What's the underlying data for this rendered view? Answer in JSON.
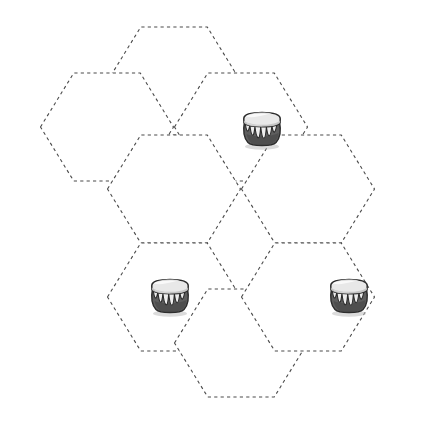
{
  "board": {
    "type": "hex-grid",
    "orientation": "flat-top",
    "width": 434,
    "height": 430,
    "background_color": "#ffffff",
    "cell_outline_color": "#4a4a4a",
    "cell_outline_style": "dashed",
    "cell_fill_color": "#ffffff",
    "hex_width": 133,
    "hex_height": 108,
    "cell_count": 7,
    "token_count": 3,
    "cells": [
      {
        "id": "cell-top-middle",
        "label": "Top Middle",
        "cx": 174,
        "cy": 81,
        "col": 1,
        "row": 0,
        "occupied": false,
        "token": null
      },
      {
        "id": "cell-upper-left",
        "label": "Upper Left",
        "cx": 107,
        "cy": 127,
        "col": 0,
        "row": 0,
        "occupied": false,
        "token": null
      },
      {
        "id": "cell-upper-right",
        "label": "Upper Right",
        "cx": 241,
        "cy": 127,
        "col": 2,
        "row": 0,
        "occupied": true,
        "token": "honey-pot"
      },
      {
        "id": "cell-center",
        "label": "Center",
        "cx": 174,
        "cy": 189,
        "col": 1,
        "row": 1,
        "occupied": false,
        "token": null
      },
      {
        "id": "cell-right",
        "label": "Right",
        "cx": 308,
        "cy": 189,
        "col": 3,
        "row": 0,
        "occupied": false,
        "token": null
      },
      {
        "id": "cell-lower-left",
        "label": "Lower Left",
        "cx": 174,
        "cy": 297,
        "col": 1,
        "row": 2,
        "occupied": true,
        "token": "honey-pot"
      },
      {
        "id": "cell-bottom-middle",
        "label": "Bottom Middle",
        "cx": 241,
        "cy": 343,
        "col": 2,
        "row": 2,
        "occupied": false,
        "token": null
      },
      {
        "id": "cell-lower-right",
        "label": "Lower Right",
        "cx": 308,
        "cy": 297,
        "col": 3,
        "row": 1,
        "occupied": true,
        "token": "honey-pot"
      }
    ]
  },
  "tokens": {
    "honey_pot": {
      "name": "honey-pot",
      "label": "Honey Pot",
      "size": 54,
      "body_color": "#5e5e5e",
      "body_dark_color": "#3c3c3c",
      "rim_color": "#e8e8e8",
      "rim_shade_color": "#c2c2c2",
      "drip_color": "#ededed",
      "outline_color": "#2b2b2b",
      "shadow_color": "#bdbdbd"
    },
    "placed": [
      {
        "id": "token-1",
        "type": "honey-pot",
        "label": "Honey Pot",
        "cell": "cell-upper-right",
        "x": 235,
        "y": 101
      },
      {
        "id": "token-2",
        "type": "honey-pot",
        "label": "Honey Pot",
        "cell": "cell-lower-left",
        "x": 143,
        "y": 268
      },
      {
        "id": "token-3",
        "type": "honey-pot",
        "label": "Honey Pot",
        "cell": "cell-lower-right",
        "x": 322,
        "y": 268
      }
    ]
  }
}
